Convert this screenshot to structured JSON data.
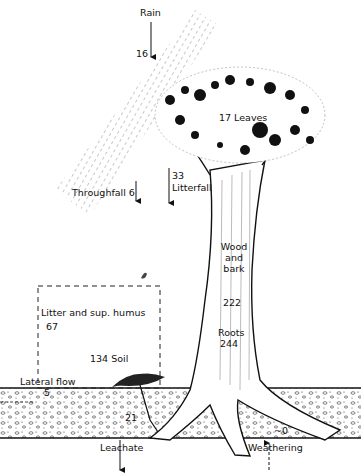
{
  "diagram": {
    "type": "nutrient cycling flows in a forest tree ecosystem",
    "labels": {
      "rain": "Rain",
      "rain_value": "16",
      "leaves": "17 Leaves",
      "throughfall": "Throughfall 6",
      "litterfall_value": "33",
      "litterfall": "Litterfall",
      "wood_line1": "Wood",
      "wood_line2": "and",
      "wood_line3": "bark",
      "wood_value": "222",
      "litter_humus": "Litter and sup. humus",
      "litter_value": "67",
      "roots": "Roots",
      "roots_value": "244",
      "soil": "134 Soil",
      "lateral_flow": "Lateral flow",
      "lateral_value": "5",
      "leachate_value": "21",
      "leachate": "Leachate",
      "weathering_value": "~0",
      "weathering": "Weathering"
    },
    "flows": [
      {
        "name": "Rain",
        "value": 16,
        "direction": "in"
      },
      {
        "name": "Throughfall",
        "value": 6,
        "direction": "down"
      },
      {
        "name": "Litterfall",
        "value": 33,
        "direction": "down"
      },
      {
        "name": "Lateral flow",
        "value": 5,
        "direction": "out"
      },
      {
        "name": "Leachate",
        "value": 21,
        "direction": "out"
      },
      {
        "name": "Weathering",
        "value": 0,
        "direction": "in"
      }
    ],
    "pools": [
      {
        "name": "Leaves",
        "value": 17
      },
      {
        "name": "Wood and bark",
        "value": 222
      },
      {
        "name": "Roots",
        "value": 244
      },
      {
        "name": "Litter and sup. humus",
        "value": 67
      },
      {
        "name": "Soil",
        "value": 134
      }
    ]
  }
}
